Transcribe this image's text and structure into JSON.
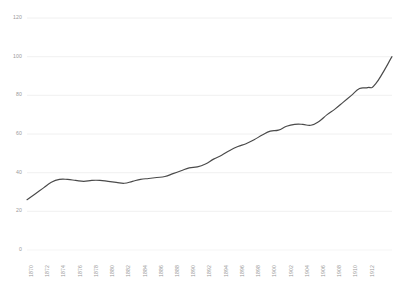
{
  "chart_data": {
    "type": "line",
    "title": "",
    "subtitle": "",
    "xlabel": "",
    "ylabel": "",
    "grid": true,
    "legend": false,
    "legend_position": "none",
    "line_color": "#4a4a4a",
    "axis_label_color": "#9a9a9a",
    "gridline_color": "#f0f0f0",
    "background_color": "#ffffff",
    "ylim": [
      0,
      120
    ],
    "yticks": [
      0,
      20,
      40,
      60,
      80,
      100,
      120
    ],
    "ytick_labels": [
      "0",
      "20",
      "40",
      "60",
      "80",
      "100",
      "120"
    ],
    "xlim": [
      1870,
      1913
    ],
    "xticks": [
      1870,
      1872,
      1874,
      1876,
      1878,
      1880,
      1882,
      1884,
      1886,
      1888,
      1890,
      1892,
      1894,
      1896,
      1898,
      1900,
      1902,
      1904,
      1906,
      1908,
      1910,
      1912
    ],
    "xtick_labels": [
      "1870",
      "1872",
      "1874",
      "1876",
      "1878",
      "1880",
      "1882",
      "1884",
      "1886",
      "1888",
      "1890",
      "1892",
      "1894",
      "1896",
      "1898",
      "1900",
      "1902",
      "1904",
      "1906",
      "1908",
      "1910",
      "1912"
    ],
    "x": [
      1870,
      1871,
      1872,
      1873,
      1874,
      1875,
      1876,
      1877,
      1878,
      1879,
      1880,
      1881,
      1882,
      1883,
      1884,
      1885,
      1886,
      1887,
      1888,
      1889,
      1890,
      1891,
      1892,
      1893,
      1894,
      1895,
      1896,
      1897,
      1898,
      1899,
      1900,
      1901,
      1902,
      1903,
      1904,
      1905,
      1906,
      1907,
      1908,
      1909,
      1910,
      1911,
      1912,
      1913
    ],
    "values": [
      26,
      29,
      32,
      35,
      36.5,
      36.5,
      36,
      35.5,
      36,
      36,
      35.5,
      35,
      34.5,
      35.5,
      36.5,
      37,
      37.5,
      38,
      39.5,
      41,
      42.5,
      43,
      44.5,
      47,
      49,
      51.5,
      53.5,
      55,
      57,
      59.5,
      61.5,
      62,
      64,
      65,
      65,
      64.5,
      66.5,
      70,
      73,
      76.5,
      80,
      83.5,
      84,
      86
    ],
    "series": [
      {
        "name": "series-1",
        "values": [
          26,
          29,
          32,
          35,
          36.5,
          36.5,
          36,
          35.5,
          36,
          36,
          35.5,
          35,
          34.5,
          35.5,
          36.5,
          37,
          37.5,
          38,
          39.5,
          41,
          42.5,
          43,
          44.5,
          47,
          49,
          51.5,
          53.5,
          55,
          57,
          59.5,
          61.5,
          62,
          64,
          65,
          65,
          64.5,
          66.5,
          70,
          73,
          76.5,
          80,
          83.5,
          84,
          86
        ]
      }
    ],
    "extended_tail": {
      "note": "line continues past last labeled tick to 100",
      "x_end": 1915,
      "y_end": 100
    }
  }
}
